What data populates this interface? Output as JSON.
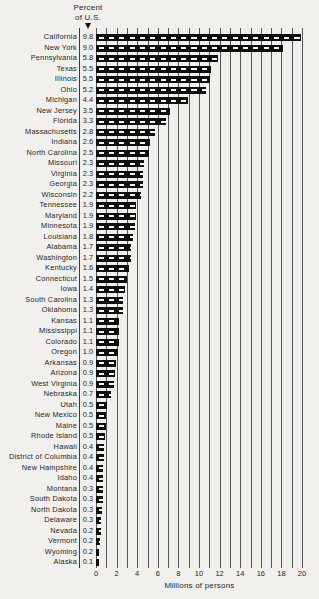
{
  "chart_data": {
    "type": "bar",
    "orientation": "horizontal",
    "header": {
      "line1": "Percent",
      "line2": "of U.S."
    },
    "xlabel": "Millions of persons",
    "xlim": [
      0,
      20
    ],
    "x_ticks": [
      "0",
      "2",
      "4",
      "6",
      "8",
      "10",
      "12",
      "14",
      "16",
      "18",
      "20"
    ],
    "gridlines": "vertical, every 1 million, full plot height",
    "legend": "none",
    "bar_color": "#0e0e0e",
    "rows": [
      {
        "state": "California",
        "percent": "9.8",
        "millions": 19.9
      },
      {
        "state": "New York",
        "percent": "9.0",
        "millions": 18.2
      },
      {
        "state": "Pennsylvania",
        "percent": "5.8",
        "millions": 11.8
      },
      {
        "state": "Texas",
        "percent": "5.5",
        "millions": 11.2
      },
      {
        "state": "Illinois",
        "percent": "5.5",
        "millions": 11.1
      },
      {
        "state": "Ohio",
        "percent": "5.2",
        "millions": 10.7
      },
      {
        "state": "Michigan",
        "percent": "4.4",
        "millions": 8.9
      },
      {
        "state": "New Jersey",
        "percent": "3.5",
        "millions": 7.2
      },
      {
        "state": "Florida",
        "percent": "3.3",
        "millions": 6.8
      },
      {
        "state": "Massachusetts",
        "percent": "2.8",
        "millions": 5.7
      },
      {
        "state": "Indiana",
        "percent": "2.6",
        "millions": 5.2
      },
      {
        "state": "North Carolina",
        "percent": "2.5",
        "millions": 5.1
      },
      {
        "state": "Missouri",
        "percent": "2.3",
        "millions": 4.7
      },
      {
        "state": "Virginia",
        "percent": "2.3",
        "millions": 4.6
      },
      {
        "state": "Georgia",
        "percent": "2.3",
        "millions": 4.6
      },
      {
        "state": "Wisconsin",
        "percent": "2.2",
        "millions": 4.4
      },
      {
        "state": "Tennessee",
        "percent": "1.9",
        "millions": 3.9
      },
      {
        "state": "Maryland",
        "percent": "1.9",
        "millions": 3.9
      },
      {
        "state": "Minnesota",
        "percent": "1.9",
        "millions": 3.8
      },
      {
        "state": "Louisiana",
        "percent": "1.8",
        "millions": 3.6
      },
      {
        "state": "Alabama",
        "percent": "1.7",
        "millions": 3.4
      },
      {
        "state": "Washington",
        "percent": "1.7",
        "millions": 3.4
      },
      {
        "state": "Kentucky",
        "percent": "1.6",
        "millions": 3.2
      },
      {
        "state": "Connecticut",
        "percent": "1.5",
        "millions": 3.0
      },
      {
        "state": "Iowa",
        "percent": "1.4",
        "millions": 2.8
      },
      {
        "state": "South Carolina",
        "percent": "1.3",
        "millions": 2.6
      },
      {
        "state": "Oklahoma",
        "percent": "1.3",
        "millions": 2.6
      },
      {
        "state": "Kansas",
        "percent": "1.1",
        "millions": 2.2
      },
      {
        "state": "Mississippi",
        "percent": "1.1",
        "millions": 2.2
      },
      {
        "state": "Colorado",
        "percent": "1.1",
        "millions": 2.2
      },
      {
        "state": "Oregon",
        "percent": "1.0",
        "millions": 2.1
      },
      {
        "state": "Arkansas",
        "percent": "0.9",
        "millions": 1.9
      },
      {
        "state": "Arizona",
        "percent": "0.9",
        "millions": 1.8
      },
      {
        "state": "West Virginia",
        "percent": "0.9",
        "millions": 1.7
      },
      {
        "state": "Nebraska",
        "percent": "0.7",
        "millions": 1.5
      },
      {
        "state": "Utah",
        "percent": "0.5",
        "millions": 1.1
      },
      {
        "state": "New Mexico",
        "percent": "0.5",
        "millions": 1.0
      },
      {
        "state": "Maine",
        "percent": "0.5",
        "millions": 1.0
      },
      {
        "state": "Rhode Island",
        "percent": "0.5",
        "millions": 0.9
      },
      {
        "state": "Hawaii",
        "percent": "0.4",
        "millions": 0.8
      },
      {
        "state": "District of Columbia",
        "percent": "0.4",
        "millions": 0.8
      },
      {
        "state": "New Hampshire",
        "percent": "0.4",
        "millions": 0.7
      },
      {
        "state": "Idaho",
        "percent": "0.4",
        "millions": 0.7
      },
      {
        "state": "Montana",
        "percent": "0.3",
        "millions": 0.7
      },
      {
        "state": "South Dakota",
        "percent": "0.3",
        "millions": 0.7
      },
      {
        "state": "North Dakota",
        "percent": "0.3",
        "millions": 0.6
      },
      {
        "state": "Delaware",
        "percent": "0.3",
        "millions": 0.5
      },
      {
        "state": "Nevada",
        "percent": "0.2",
        "millions": 0.5
      },
      {
        "state": "Vermont",
        "percent": "0.2",
        "millions": 0.4
      },
      {
        "state": "Wyoming",
        "percent": "0.2",
        "millions": 0.3
      },
      {
        "state": "Alaska",
        "percent": "0.1",
        "millions": 0.3
      }
    ]
  }
}
